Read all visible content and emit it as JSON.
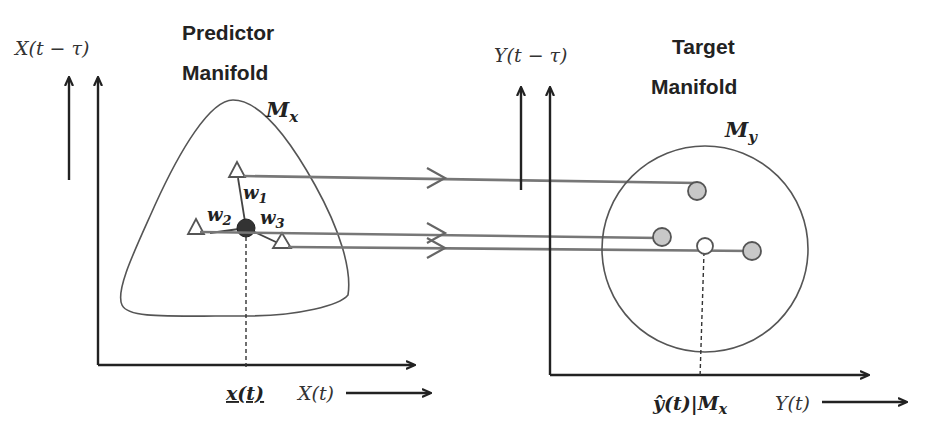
{
  "predictor": {
    "title_line1": "Predictor",
    "title_line2": "Manifold",
    "manifold_label": "M",
    "manifold_sub": "x",
    "y_axis_label": "X(t − τ)",
    "x_axis_label": "X(t)",
    "point_label": "x(t)",
    "weights": [
      {
        "w": "w",
        "sub": "1"
      },
      {
        "w": "w",
        "sub": "2"
      },
      {
        "w": "w",
        "sub": "3"
      }
    ]
  },
  "target": {
    "title_line1": "Target",
    "title_line2": "Manifold",
    "manifold_label": "M",
    "manifold_sub": "y",
    "y_axis_label": "Y(t − τ)",
    "x_axis_label": "Y(t)",
    "estimate_label": "ŷ(t)|M",
    "estimate_sub": "x"
  },
  "colors": {
    "line": "#555555",
    "axis": "#222222",
    "point_fill": "#c8c8c8",
    "center_fill": "#333333"
  }
}
